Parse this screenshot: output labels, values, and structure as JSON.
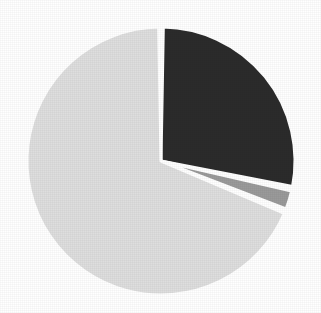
{
  "chart_data": {
    "type": "pie",
    "title": "",
    "subtitle": "",
    "xlabel": "",
    "ylabel": "",
    "grid": false,
    "legend": "none",
    "labels_visible": false,
    "center_x": 161,
    "center_y": 161,
    "radius": 134,
    "start_angle_deg": 0,
    "direction": "clockwise",
    "separator_color": "#ffffff",
    "separator_width_px": 3,
    "background_color": "#ffffff",
    "categories": [
      "Segment 1",
      "Segment 2",
      "Segment 3"
    ],
    "values": [
      27.8,
      2.2,
      68.3
    ],
    "angles_deg": [
      100,
      8,
      246
    ],
    "slices": [
      {
        "name": "Segment 1",
        "value": 27.8,
        "angle_deg": 100,
        "start_deg": 1,
        "end_deg": 101,
        "color": "#2b2b2b",
        "exploded": false
      },
      {
        "name": "Segment 2",
        "value": 2.2,
        "angle_deg": 8,
        "start_deg": 103,
        "end_deg": 111,
        "color": "#9a9a9a",
        "exploded": false
      },
      {
        "name": "Segment 3",
        "value": 68.3,
        "angle_deg": 246,
        "start_deg": 113,
        "end_deg": 359,
        "color": "#dedede",
        "exploded": false
      }
    ]
  },
  "figure": {
    "title_clipped": "",
    "width": 321,
    "height": 313
  }
}
